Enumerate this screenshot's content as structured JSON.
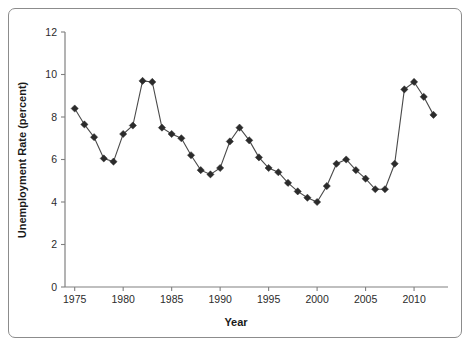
{
  "figure": {
    "border_color": "#8c8c8c",
    "background": "#ffffff"
  },
  "chart_data": {
    "type": "line",
    "title": "",
    "xlabel": "Year",
    "ylabel": "Unemployment Rate (percent)",
    "xlim": [
      1974,
      2013.5
    ],
    "ylim": [
      0,
      12
    ],
    "xticks": [
      1975,
      1980,
      1985,
      1990,
      1995,
      2000,
      2005,
      2010
    ],
    "xtick_labels": [
      "1975",
      "1980",
      "1985",
      "1990",
      "1995",
      "2000",
      "2005",
      "2010"
    ],
    "yticks": [
      0,
      2,
      4,
      6,
      8,
      10,
      12
    ],
    "ytick_labels": [
      "0",
      "2",
      "4",
      "6",
      "8",
      "10",
      "12"
    ],
    "grid": false,
    "legend": null,
    "marker": "diamond",
    "marker_color": "#2b2b2b",
    "line_color": "#4a4a4a",
    "x": [
      1975,
      1976,
      1977,
      1978,
      1979,
      1980,
      1981,
      1982,
      1983,
      1984,
      1985,
      1986,
      1987,
      1988,
      1989,
      1990,
      1991,
      1992,
      1993,
      1994,
      1995,
      1996,
      1997,
      1998,
      1999,
      2000,
      2001,
      2002,
      2003,
      2004,
      2005,
      2006,
      2007,
      2008,
      2009,
      2010,
      2011,
      2012
    ],
    "values": [
      8.4,
      7.65,
      7.05,
      6.05,
      5.9,
      7.2,
      7.6,
      9.7,
      9.65,
      7.5,
      7.2,
      7.0,
      6.2,
      5.5,
      5.3,
      5.6,
      6.85,
      7.5,
      6.9,
      6.1,
      5.6,
      5.4,
      4.9,
      4.5,
      4.2,
      4.0,
      4.75,
      5.8,
      6.0,
      5.5,
      5.1,
      4.6,
      4.6,
      5.8,
      9.3,
      9.65,
      8.95,
      8.1
    ],
    "series": [
      {
        "name": "Unemployment Rate",
        "values": [
          8.4,
          7.65,
          7.05,
          6.05,
          5.9,
          7.2,
          7.6,
          9.7,
          9.65,
          7.5,
          7.2,
          7.0,
          6.2,
          5.5,
          5.3,
          5.6,
          6.85,
          7.5,
          6.9,
          6.1,
          5.6,
          5.4,
          4.9,
          4.5,
          4.2,
          4.0,
          4.75,
          5.8,
          6.0,
          5.5,
          5.1,
          4.6,
          4.6,
          5.8,
          9.3,
          9.65,
          8.95,
          8.1
        ]
      }
    ]
  }
}
